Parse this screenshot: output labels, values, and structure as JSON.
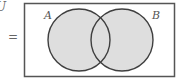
{
  "diagram": {
    "type": "venn",
    "universe_label": "U",
    "equals_sign": "=",
    "sets": [
      {
        "label": "A",
        "cx": 79,
        "cy": 40,
        "r": 31
      },
      {
        "label": "B",
        "cx": 122,
        "cy": 40,
        "r": 31
      }
    ],
    "shaded_region": "A ∪ B",
    "colors": {
      "fill": "#dedede",
      "stroke": "#3f3f3f",
      "frame": "#555555"
    }
  }
}
